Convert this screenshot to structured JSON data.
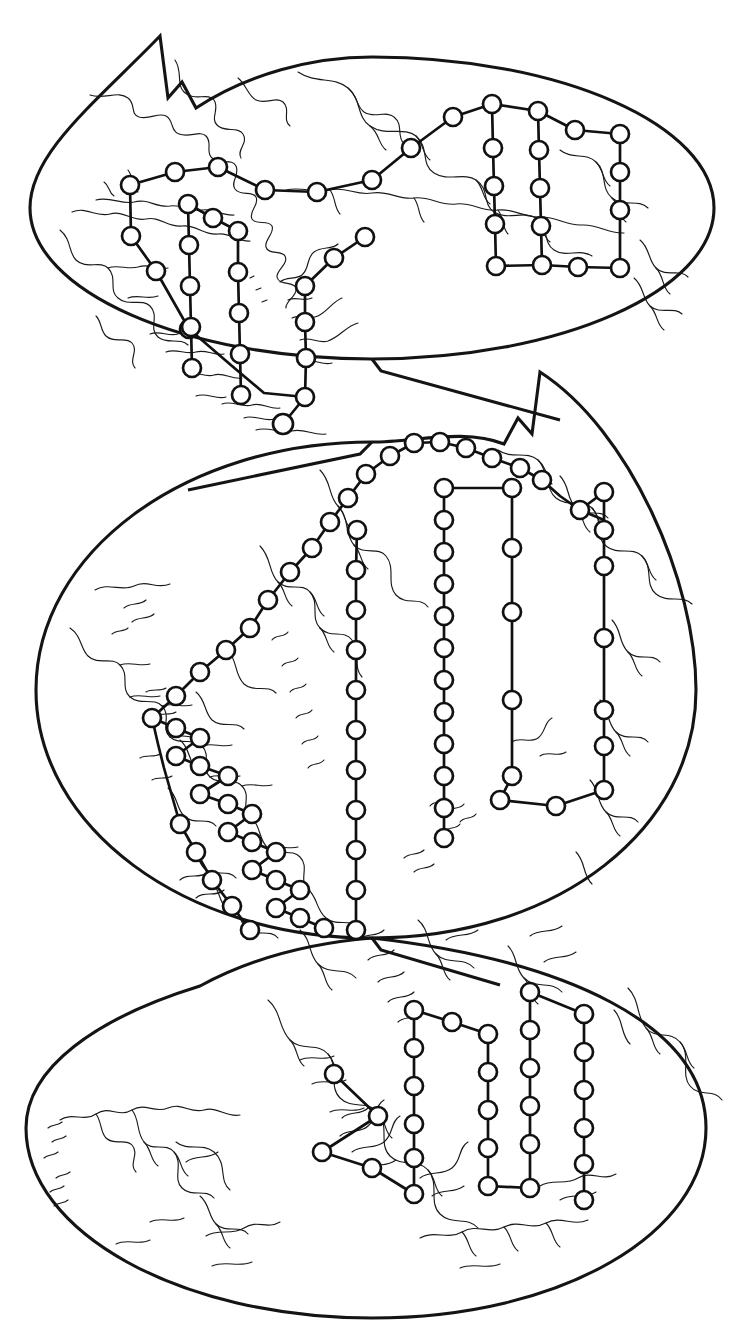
{
  "figure": {
    "background_color": "#ffffff",
    "ink_color": "#111111",
    "coast_color": "#1a1a1a",
    "node_fill_color": "#ffffff",
    "width": 729,
    "height": 1336,
    "lobe_count": 3,
    "node_radius": 9,
    "node_stroke_width": 2.7,
    "lobe_stroke_width": 3.1,
    "coast_stroke_width": 1.15,
    "node_count_total": 128,
    "labels_present": false,
    "axis_present": false,
    "legend_present": false
  },
  "lobes": [
    {
      "name": "top-lobe",
      "center_x": 372,
      "center_y": 208,
      "radius_x": 342,
      "radius_y": 188,
      "notch": "upper-left wedge",
      "node_count": 42
    },
    {
      "name": "middle-lobe",
      "center_x": 366,
      "center_y": 690,
      "radius_x": 330,
      "radius_y": 248,
      "notch": "upper-right wedge",
      "node_count": 48
    },
    {
      "name": "bottom-lobe",
      "center_x": 366,
      "center_y": 1128,
      "radius_x": 340,
      "radius_y": 190,
      "notch": "upper-left wedge",
      "node_count": 38
    }
  ],
  "networks": [
    {
      "id": "top-trunk",
      "lobe": "top-lobe",
      "type": "polyline",
      "points": [
        [
          130,
          185
        ],
        [
          175,
          172
        ],
        [
          218,
          167
        ],
        [
          265,
          190
        ],
        [
          317,
          192
        ],
        [
          372,
          180
        ],
        [
          411,
          148
        ],
        [
          453,
          117
        ],
        [
          492,
          104
        ],
        [
          538,
          111
        ]
      ]
    },
    {
      "id": "top-branch-west",
      "lobe": "top-lobe",
      "type": "polyline",
      "points": [
        [
          130,
          185
        ],
        [
          131,
          236
        ],
        [
          156,
          271
        ],
        [
          189,
          329
        ],
        [
          232,
          366
        ],
        [
          264,
          393
        ],
        [
          305,
          397
        ]
      ]
    },
    {
      "id": "top-ladder-a",
      "lobe": "top-lobe",
      "type": "polyline",
      "points": [
        [
          188,
          204
        ],
        [
          189,
          245
        ],
        [
          190,
          286
        ],
        [
          191,
          327
        ],
        [
          192,
          368
        ]
      ]
    },
    {
      "id": "top-ladder-a-top",
      "lobe": "top-lobe",
      "type": "polyline",
      "points": [
        [
          188,
          204
        ],
        [
          213,
          218
        ],
        [
          238,
          231
        ]
      ]
    },
    {
      "id": "top-ladder-b",
      "lobe": "top-lobe",
      "type": "polyline",
      "points": [
        [
          238,
          231
        ],
        [
          238,
          272
        ],
        [
          239,
          313
        ],
        [
          240,
          354
        ],
        [
          241,
          395
        ]
      ]
    },
    {
      "id": "top-branch-center",
      "lobe": "top-lobe",
      "type": "polyline",
      "points": [
        [
          305,
          286
        ],
        [
          334,
          258
        ],
        [
          365,
          237
        ]
      ]
    },
    {
      "id": "top-chain-center",
      "lobe": "top-lobe",
      "type": "polyline",
      "points": [
        [
          305,
          286
        ],
        [
          305,
          322
        ],
        [
          306,
          358
        ],
        [
          305,
          397
        ]
      ]
    },
    {
      "id": "top-box-left-col",
      "lobe": "top-lobe",
      "type": "polyline",
      "points": [
        [
          492,
          104
        ],
        [
          493,
          148
        ],
        [
          494,
          186
        ],
        [
          495,
          224
        ],
        [
          496,
          262
        ],
        [
          496,
          266
        ]
      ]
    },
    {
      "id": "top-box-mid-col",
      "lobe": "top-lobe",
      "type": "polyline",
      "points": [
        [
          538,
          111
        ],
        [
          539,
          150
        ],
        [
          540,
          188
        ],
        [
          541,
          226
        ],
        [
          542,
          265
        ]
      ]
    },
    {
      "id": "top-box-right-col",
      "lobe": "top-lobe",
      "type": "polyline",
      "points": [
        [
          620,
          134
        ],
        [
          620,
          172
        ],
        [
          620,
          210
        ],
        [
          620,
          230
        ],
        [
          620,
          268
        ]
      ]
    },
    {
      "id": "top-box-top",
      "lobe": "top-lobe",
      "type": "polyline",
      "points": [
        [
          538,
          111
        ],
        [
          575,
          130
        ],
        [
          620,
          134
        ]
      ]
    },
    {
      "id": "top-box-bottom",
      "lobe": "top-lobe",
      "type": "polyline",
      "points": [
        [
          496,
          266
        ],
        [
          542,
          265
        ],
        [
          578,
          267
        ],
        [
          620,
          268
        ]
      ]
    }
  ],
  "chart_data": {
    "type": "map-network",
    "title": "",
    "projection": "interrupted lobed (butterfly) world projection, 3 lobes",
    "series": [
      {
        "name": "top-lobe network",
        "node_count": 42
      },
      {
        "name": "middle-lobe network",
        "node_count": 48
      },
      {
        "name": "bottom-lobe network",
        "node_count": 38
      }
    ],
    "annotations": [],
    "xlabel": "",
    "ylabel": "",
    "legend": "none",
    "grid": false
  }
}
